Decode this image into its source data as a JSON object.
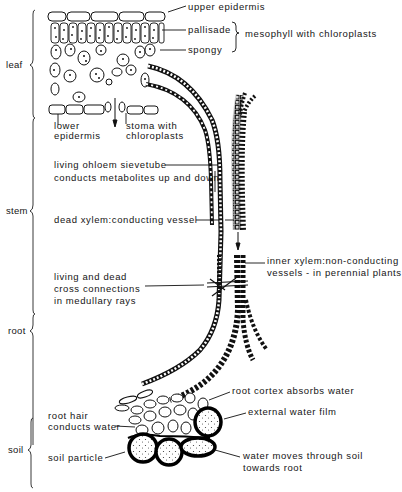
{
  "regions": {
    "leaf": "leaf",
    "stem": "stem",
    "root": "root",
    "soil": "soil"
  },
  "labels": {
    "upper_epidermis": "upper epidermis",
    "pallisade": "pallisade",
    "mesophyll": "mesophyll with chloroplasts",
    "spongy": "spongy",
    "lower_epidermis_1": "lower",
    "lower_epidermis_2": "epidermis",
    "stoma_1": "stoma with",
    "stoma_2": "chloroplasts",
    "phloem_1": "living ohloem sievetube",
    "phloem_2": "conducts metabolites up and down",
    "xylem_dead": "dead xylem:conducting vessel",
    "inner_xylem_1": "inner xylem:non-conducting",
    "inner_xylem_2": "vessels - in perennial plants",
    "rays_1": "living and dead",
    "rays_2": "cross connections",
    "rays_3": "in medullary rays",
    "root_cortex": "root cortex absorbs water",
    "root_hair_1": "root hair",
    "root_hair_2": "conducts water",
    "water_film": "external water film",
    "soil_particle": "soil particle",
    "water_moves_1": "water moves through soil",
    "water_moves_2": "towards root"
  },
  "colors": {
    "ink": "#151515",
    "background": "#ffffff"
  }
}
